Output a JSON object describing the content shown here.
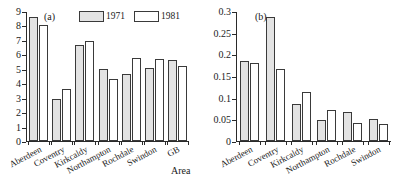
{
  "figure": {
    "xlabel": "Area",
    "legend_labels": [
      "1971",
      "1981"
    ]
  },
  "panels": [
    {
      "tag": "(a)",
      "legend": [
        {
          "label": "1971",
          "style": "hatched"
        },
        {
          "label": "1981",
          "style": "white"
        }
      ]
    },
    {
      "tag": "(b)",
      "legend": [
        {
          "label": "1971",
          "style": "hatched"
        },
        {
          "label": "1981",
          "style": "white"
        }
      ]
    }
  ],
  "chart_data": [
    {
      "type": "bar",
      "title": "(a)",
      "xlabel": "Area",
      "ylabel": "",
      "ylim": [
        0,
        9
      ],
      "yticks": [
        0,
        1,
        2,
        3,
        4,
        5,
        6,
        7,
        8,
        9
      ],
      "ytick_labels": [
        "0",
        "1",
        "2",
        "3",
        "4",
        "5",
        "6",
        "7",
        "8",
        "9"
      ],
      "grid": false,
      "legend_position": "top-right",
      "categories": [
        "Aberdeen",
        "Coventry",
        "Kirkcaldy",
        "Northampton",
        "Rochdale",
        "Swindon",
        "GB"
      ],
      "series": [
        {
          "name": "1971",
          "values": [
            8.65,
            2.95,
            6.7,
            5.05,
            4.7,
            5.1,
            5.65
          ]
        },
        {
          "name": "1981",
          "values": [
            8.1,
            3.65,
            7.0,
            4.35,
            5.8,
            5.75,
            5.25
          ]
        }
      ]
    },
    {
      "type": "bar",
      "title": "(b)",
      "xlabel": "Area",
      "ylabel": "",
      "ylim": [
        0,
        0.3
      ],
      "yticks": [
        0,
        0.05,
        0.1,
        0.15,
        0.2,
        0.25,
        0.3
      ],
      "ytick_labels": [
        "0",
        "0.05",
        "0.1",
        "0.15",
        "0.2",
        "0.25",
        "0.3"
      ],
      "grid": false,
      "legend_position": "top-right",
      "categories": [
        "Aberdeen",
        "Coventry",
        "Kirkcaldy",
        "Northampton",
        "Rochdale",
        "Swindon"
      ],
      "series": [
        {
          "name": "1971",
          "values": [
            0.185,
            0.289,
            0.085,
            0.048,
            0.068,
            0.052
          ]
        },
        {
          "name": "1981",
          "values": [
            0.182,
            0.168,
            0.114,
            0.072,
            0.041,
            0.039
          ]
        }
      ]
    }
  ]
}
